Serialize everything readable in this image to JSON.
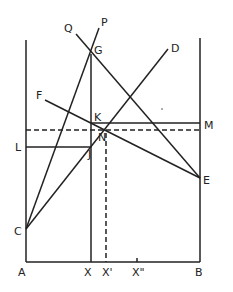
{
  "diagram": {
    "type": "geometric construction",
    "labels": {
      "P": "P",
      "Q": "Q",
      "G": "G",
      "D": "D",
      "F": "F",
      "K": "K",
      "M": "M",
      "L": "L",
      "J": "J",
      "N": "N",
      "E": "E",
      "C": "C",
      "A": "A",
      "X": "X",
      "X1": "X'",
      "X2": "X\"",
      "B": "B"
    },
    "points": {
      "A": [
        26,
        262
      ],
      "B": [
        200,
        262
      ],
      "C": [
        26,
        229
      ],
      "G": [
        91,
        54
      ],
      "P": [
        99,
        28
      ],
      "Q": [
        76,
        34
      ],
      "D": [
        168,
        49
      ],
      "F": [
        45,
        100
      ],
      "E": [
        200,
        178
      ],
      "K": [
        91,
        123
      ],
      "M": [
        200,
        123
      ],
      "L": [
        26,
        147
      ],
      "J": [
        91,
        147
      ],
      "N": [
        106,
        130
      ],
      "X": [
        91,
        262
      ],
      "X1": [
        106,
        262
      ],
      "X2": [
        137,
        262
      ]
    },
    "line_color": "#222222"
  }
}
